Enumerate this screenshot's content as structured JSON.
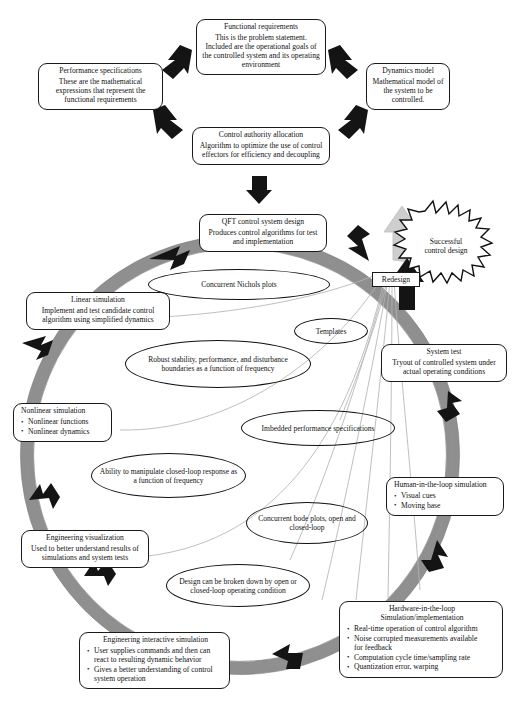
{
  "figure": {
    "kind": "process-flow-diagram",
    "colors": {
      "ring": "#8c8c8c",
      "ring_edge": "#6f6f6f",
      "arrow_dark": "#1a1a1a",
      "arrow_light": "#c9c9c9",
      "leader_line": "#a8a8a8",
      "outline": "#111111",
      "background": "#ffffff"
    }
  },
  "top_flow": {
    "functional_requirements": {
      "title": "Functional requirements",
      "body": "This is the problem statement. Included are the operational goals of the controlled system and its operating environment"
    },
    "performance_specifications": {
      "title": "Performance specifications",
      "body": "These are the mathematical expressions that represent the functional requirements"
    },
    "dynamics_model": {
      "title": "Dynamics model",
      "body": "Mathematical model of the system to be controlled."
    },
    "control_authority_allocation": {
      "title": "Control authority allocation",
      "body": "Algorithm to optimize the use of control effectors for efficiency and decoupling"
    }
  },
  "loop": {
    "qft_control_system_design": {
      "title": "QFT control system design",
      "body": "Produces control algorithms for test and implementation"
    },
    "linear_simulation": {
      "title": "Linear simulation",
      "body": "Implement and test candidate control algorithm using simplified dynamics"
    },
    "nonlinear_simulation": {
      "title": "Nonlinear simulation",
      "bullets": [
        "Nonlinear functions",
        "Nonlinear dynamics"
      ]
    },
    "engineering_visualization": {
      "title": "Engineering visualization",
      "body": "Used to better understand results of simulations and system tests"
    },
    "engineering_interactive_simulation": {
      "title": "Engineering interactive simulation",
      "bullets": [
        "User supplies commands and then can react to resulting dynamic behavior",
        "Gives a better understanding of control system operation"
      ]
    },
    "hardware_in_the_loop": {
      "title": "Hardware-in-the-loop Simulation/implementation",
      "title_line1": "Hardware-in-the-loop",
      "title_line2": "Simulation/implementation",
      "bullets": [
        "Real-time operation of control algorithm",
        "Noise corrupted measurements available for feedback",
        "Computation cycle time/sampling rate",
        "Quantization error, warping"
      ],
      "bullet2_cont": "for feedback"
    },
    "human_in_the_loop": {
      "title": "Human-in-the-loop simulation",
      "bullets": [
        "Visual cues",
        "Moving base"
      ]
    },
    "system_test": {
      "title": "System test",
      "body": "Tryout of controlled system under actual operating conditions"
    }
  },
  "decision": {
    "redesign": "Redesign",
    "successful": "Successful control design",
    "successful_line1": "Successful",
    "successful_line2": "control design"
  },
  "annotations": {
    "concurrent_nichols_plots": "Concurrent Nichols plots",
    "templates": "Templates",
    "robust_stability": "Robust stability, performance, and disturbance boundaries as a function of frequency",
    "imbedded_performance": "Imbedded performance specifications",
    "ability_to_manipulate": "Ability to manipulate closed-loop response as a function of frequency",
    "concurrent_bode": "Concurrent bode plots, open and closed-loop",
    "design_broken_down": "Design can be broken down by open or closed-loop operating condition"
  }
}
